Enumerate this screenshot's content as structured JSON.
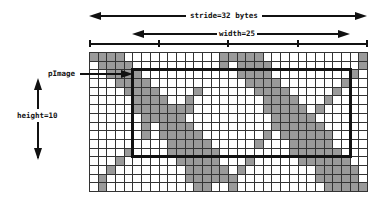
{
  "labels": {
    "stride": "stride=32 bytes",
    "width": "width=25",
    "height": "height=10",
    "pointer": "pImage"
  },
  "grid": {
    "columns": 32,
    "rows": 16,
    "roi": {
      "col": 5,
      "row": 2,
      "width": 25,
      "height": 10
    },
    "shaded_rows": [
      [
        0,
        1,
        2,
        3,
        15,
        16,
        17,
        18,
        19,
        31
      ],
      [
        1,
        2,
        3,
        4,
        15,
        17,
        18,
        19,
        20,
        31
      ],
      [
        2,
        3,
        4,
        5,
        17,
        18,
        19,
        20,
        30
      ],
      [
        3,
        4,
        5,
        6,
        18,
        19,
        20,
        21,
        29
      ],
      [
        4,
        5,
        6,
        7,
        12,
        19,
        20,
        21,
        22,
        28
      ],
      [
        5,
        6,
        7,
        8,
        11,
        20,
        21,
        22,
        23,
        27
      ],
      [
        5,
        6,
        7,
        8,
        9,
        10,
        11,
        20,
        21,
        22,
        23,
        24,
        26
      ],
      [
        6,
        7,
        8,
        9,
        10,
        21,
        22,
        23,
        24,
        25
      ],
      [
        6,
        8,
        9,
        10,
        11,
        21,
        22,
        23,
        24,
        25,
        26
      ],
      [
        6,
        8,
        9,
        10,
        11,
        12,
        20,
        22,
        23,
        24,
        25,
        26,
        27
      ],
      [
        9,
        10,
        11,
        12,
        13,
        19,
        23,
        24,
        25,
        26,
        27
      ],
      [
        4,
        9,
        10,
        11,
        12,
        13,
        14,
        23,
        24,
        25,
        26,
        27,
        28
      ],
      [
        3,
        10,
        11,
        12,
        13,
        14,
        18,
        24,
        25,
        26,
        27,
        28,
        29
      ],
      [
        2,
        11,
        12,
        13,
        14,
        15,
        17,
        26,
        27,
        28,
        29,
        30
      ],
      [
        1,
        11,
        12,
        13,
        14,
        15,
        16,
        26,
        27,
        28,
        29,
        30
      ],
      [
        1,
        12,
        13,
        16,
        27,
        28,
        29,
        30,
        31
      ]
    ]
  },
  "ruler": {
    "ticks_every_cols": 8
  },
  "colors": {
    "shade": "#9a9a9a",
    "line": "#111111",
    "background": "#ffffff"
  }
}
